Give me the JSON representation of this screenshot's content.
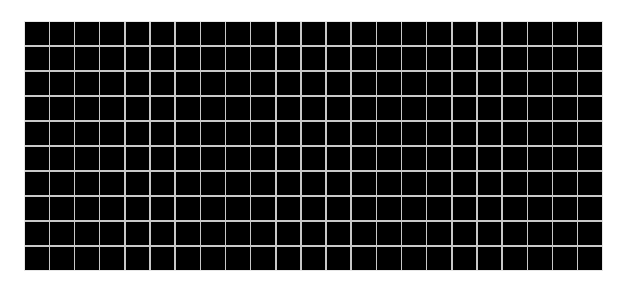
{
  "canvas": {
    "width": 620,
    "height": 290,
    "background": "#ffffff"
  },
  "caption": {
    "text": ""
  },
  "grid": {
    "columns": 23,
    "rows": 10,
    "cell_color": "#000000",
    "line_color": "#c8c8c8",
    "left": 24,
    "top": 21,
    "width": 579,
    "height": 250
  }
}
